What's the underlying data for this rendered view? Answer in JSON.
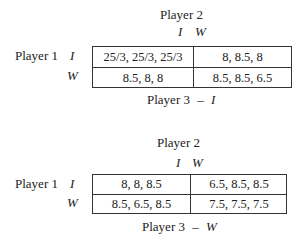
{
  "games": [
    {
      "column_player": "Player 2",
      "column_strategies": [
        "I",
        "W"
      ],
      "row_player": "Player 1",
      "row_strategies": [
        "I",
        "W"
      ],
      "payoffs": [
        [
          "25/3, 25/3, 25/3",
          "8, 8.5, 8"
        ],
        [
          "8.5, 8, 8",
          "8.5, 8.5, 6.5"
        ]
      ],
      "caption_player": "Player 3",
      "caption_dash": "–",
      "caption_strategy": "I"
    },
    {
      "column_player": "Player 2",
      "column_strategies": [
        "I",
        "W"
      ],
      "row_player": "Player 1",
      "row_strategies": [
        "I",
        "W"
      ],
      "payoffs": [
        [
          "8, 8, 8.5",
          "6.5, 8.5, 8.5"
        ],
        [
          "8.5, 6.5, 8.5",
          "7.5, 7.5, 7.5"
        ]
      ],
      "caption_player": "Player 3",
      "caption_dash": "–",
      "caption_strategy": "W"
    }
  ]
}
